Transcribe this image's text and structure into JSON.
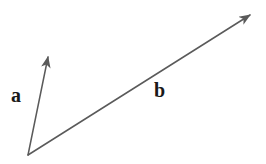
{
  "figure": {
    "width": 266,
    "height": 164,
    "background_color": "#ffffff",
    "stroke_color": "#5a5a5a",
    "label_color": "#1a1a1a",
    "stroke_width": 1.5
  },
  "chart_data": {
    "type": "scatter",
    "title": "",
    "xlabel": "",
    "ylabel": "",
    "grid": false,
    "legend": "none",
    "xlim": [
      0,
      266
    ],
    "ylim": [
      0,
      164
    ],
    "origin": {
      "x": 28,
      "y": 155
    },
    "series": [
      {
        "name": "a",
        "label": "a",
        "kind": "vector-arrow",
        "start": {
          "x": 28,
          "y": 155
        },
        "end": {
          "x": 48,
          "y": 57
        },
        "dx": 20,
        "dy": -98,
        "length_px": 100,
        "angle_deg": 78.5,
        "color": "#5a5a5a",
        "label_position": {
          "x": 11,
          "y": 85
        }
      },
      {
        "name": "b",
        "label": "b",
        "kind": "vector-arrow",
        "start": {
          "x": 28,
          "y": 155
        },
        "end": {
          "x": 250,
          "y": 15
        },
        "dx": 222,
        "dy": -140,
        "length_px": 262,
        "angle_deg": 32.2,
        "color": "#5a5a5a",
        "label_position": {
          "x": 154,
          "y": 80
        }
      }
    ]
  },
  "labels": {
    "vector_a": "a",
    "vector_b": "b"
  }
}
